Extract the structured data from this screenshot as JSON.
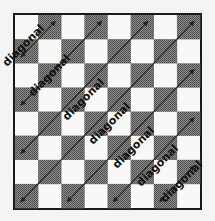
{
  "diagram": {
    "title": "",
    "board": {
      "rows": 8,
      "cols": 8,
      "dark_color": "#6b6b6b",
      "light_color": "#f8f8f6"
    },
    "label_text": "diagonal",
    "diagonals": [
      {
        "label": "diagonal"
      },
      {
        "label": "diagonal"
      },
      {
        "label": "diagonal"
      },
      {
        "label": "diagonal"
      },
      {
        "label": "diagonal"
      },
      {
        "label": "diagonal"
      },
      {
        "label": "diagonal"
      },
      {
        "label": "diagonal"
      }
    ]
  }
}
